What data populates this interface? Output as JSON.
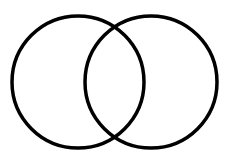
{
  "diagram": {
    "type": "venn",
    "background": "#ffffff",
    "stroke_color": "#000000",
    "stroke_width": 3.5,
    "circles": [
      {
        "name": "left-circle",
        "cx": 78,
        "cy": 82,
        "r": 66
      },
      {
        "name": "right-circle",
        "cx": 151,
        "cy": 82,
        "r": 66
      }
    ]
  }
}
